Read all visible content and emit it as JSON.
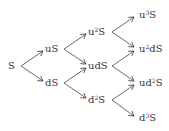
{
  "diagram": {
    "type": "binomial-tree",
    "steps": 3,
    "nodes": [
      {
        "id": "n0",
        "base": "S",
        "pre": "",
        "sup": "",
        "post": "S",
        "x": 8,
        "y": 66
      },
      {
        "id": "n1u",
        "pre": "u",
        "sup": "",
        "post": "S",
        "x": 45,
        "y": 49
      },
      {
        "id": "n1d",
        "pre": "d",
        "sup": "",
        "post": "S",
        "x": 45,
        "y": 83
      },
      {
        "id": "n2uu",
        "pre": "u",
        "sup": "2",
        "post": "S",
        "x": 88,
        "y": 32
      },
      {
        "id": "n2ud",
        "pre": "ud",
        "sup": "",
        "post": "S",
        "x": 88,
        "y": 66
      },
      {
        "id": "n2dd",
        "pre": "d",
        "sup": "2",
        "post": "S",
        "x": 88,
        "y": 100
      },
      {
        "id": "n3uuu",
        "pre": "u",
        "sup": "3",
        "post": "S",
        "x": 139,
        "y": 15
      },
      {
        "id": "n3uud",
        "pre": "u",
        "sup": "2",
        "post": "dS",
        "x": 139,
        "y": 49
      },
      {
        "id": "n3udd",
        "pre": "ud",
        "sup": "2",
        "post": "S",
        "x": 139,
        "y": 83
      },
      {
        "id": "n3ddd",
        "pre": "d",
        "sup": "3",
        "post": "S",
        "x": 139,
        "y": 118
      }
    ],
    "edges": [
      {
        "from": [
          21,
          66
        ],
        "to": [
          43,
          51
        ]
      },
      {
        "from": [
          21,
          66
        ],
        "to": [
          43,
          81
        ]
      },
      {
        "from": [
          64,
          49
        ],
        "to": [
          86,
          34
        ]
      },
      {
        "from": [
          64,
          49
        ],
        "to": [
          86,
          64
        ]
      },
      {
        "from": [
          64,
          83
        ],
        "to": [
          86,
          68
        ]
      },
      {
        "from": [
          64,
          83
        ],
        "to": [
          86,
          98
        ]
      },
      {
        "from": [
          112,
          32
        ],
        "to": [
          134,
          17
        ]
      },
      {
        "from": [
          112,
          32
        ],
        "to": [
          134,
          47
        ]
      },
      {
        "from": [
          112,
          66
        ],
        "to": [
          134,
          51
        ]
      },
      {
        "from": [
          112,
          66
        ],
        "to": [
          134,
          81
        ]
      },
      {
        "from": [
          112,
          100
        ],
        "to": [
          134,
          85
        ]
      },
      {
        "from": [
          112,
          100
        ],
        "to": [
          134,
          116
        ]
      }
    ],
    "line_color": "#444444"
  }
}
